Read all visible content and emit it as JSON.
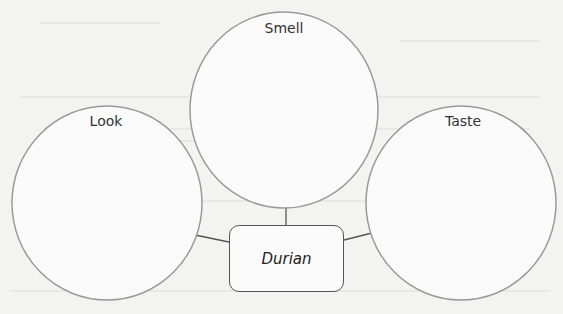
{
  "diagram": {
    "type": "concept-map",
    "center": {
      "label": "Durian"
    },
    "nodes": [
      {
        "id": "smell",
        "label": "Smell"
      },
      {
        "id": "look",
        "label": "Look"
      },
      {
        "id": "taste",
        "label": "Taste"
      }
    ],
    "colors": {
      "circle_stroke": "#9a9a9a",
      "connector": "#555555",
      "box_stroke": "#555555",
      "background": "#f3f3f2"
    }
  }
}
